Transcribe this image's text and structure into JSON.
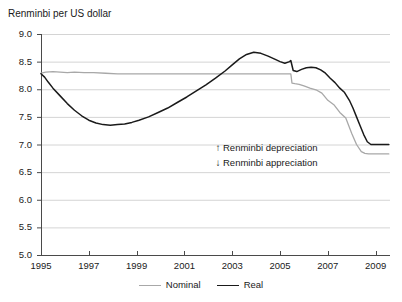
{
  "chart_data": {
    "type": "line",
    "title": "Renminbi per US dollar",
    "xlabel": "",
    "ylabel": "",
    "xlim": [
      1995,
      2009.6
    ],
    "ylim": [
      5.0,
      9.0
    ],
    "grid": true,
    "legend_position": "bottom-center",
    "y_ticks": [
      "9.0",
      "8.5",
      "8.0",
      "7.5",
      "7.0",
      "6.5",
      "6.0",
      "5.5",
      "5.0"
    ],
    "y_tick_values": [
      9.0,
      8.5,
      8.0,
      7.5,
      7.0,
      6.5,
      6.0,
      5.5,
      5.0
    ],
    "x_ticks": [
      "1995",
      "1997",
      "1999",
      "2001",
      "2003",
      "2005",
      "2007",
      "2009"
    ],
    "x_tick_values": [
      1995,
      1997,
      1999,
      2001,
      2003,
      2005,
      2007,
      2009
    ],
    "series": [
      {
        "name": "Nominal",
        "color": "#a8a8a8",
        "width": 1.3,
        "x": [
          1995.0,
          1995.2,
          1995.5,
          1995.8,
          1996.1,
          1996.4,
          1996.8,
          1997.2,
          1997.7,
          1998.2,
          1999.0,
          2000.0,
          2001.0,
          2002.0,
          2003.0,
          2004.0,
          2005.0,
          2005.45,
          2005.5,
          2005.62,
          2005.8,
          2006.0,
          2006.25,
          2006.5,
          2006.75,
          2007.0,
          2007.25,
          2007.5,
          2007.75,
          2008.0,
          2008.2,
          2008.4,
          2008.55,
          2008.7,
          2009.0,
          2009.3,
          2009.55
        ],
        "y": [
          8.29,
          8.31,
          8.32,
          8.31,
          8.3,
          8.31,
          8.3,
          8.3,
          8.29,
          8.28,
          8.28,
          8.28,
          8.28,
          8.28,
          8.28,
          8.28,
          8.28,
          8.28,
          8.11,
          8.1,
          8.09,
          8.06,
          8.02,
          7.99,
          7.93,
          7.8,
          7.72,
          7.58,
          7.48,
          7.2,
          7.0,
          6.87,
          6.84,
          6.83,
          6.83,
          6.83,
          6.83
        ]
      },
      {
        "name": "Real",
        "color": "#1a1a1a",
        "width": 1.5,
        "x": [
          1995.0,
          1995.15,
          1995.3,
          1995.5,
          1995.8,
          1996.1,
          1996.4,
          1996.7,
          1997.0,
          1997.3,
          1997.6,
          1997.9,
          1998.2,
          1998.5,
          1998.8,
          1999.1,
          1999.5,
          1999.9,
          2000.3,
          2000.7,
          2001.1,
          2001.5,
          2001.9,
          2002.3,
          2002.7,
          2003.0,
          2003.3,
          2003.6,
          2003.9,
          2004.2,
          2004.5,
          2004.8,
          2005.0,
          2005.2,
          2005.4,
          2005.45,
          2005.55,
          2005.7,
          2005.9,
          2006.1,
          2006.3,
          2006.5,
          2006.7,
          2006.9,
          2007.1,
          2007.3,
          2007.5,
          2007.7,
          2007.9,
          2008.05,
          2008.2,
          2008.35,
          2008.5,
          2008.65,
          2008.8,
          2009.0,
          2009.3,
          2009.55
        ],
        "y": [
          8.28,
          8.22,
          8.13,
          8.02,
          7.88,
          7.74,
          7.62,
          7.52,
          7.44,
          7.39,
          7.36,
          7.35,
          7.36,
          7.37,
          7.4,
          7.44,
          7.5,
          7.58,
          7.66,
          7.76,
          7.86,
          7.97,
          8.08,
          8.2,
          8.33,
          8.44,
          8.55,
          8.63,
          8.67,
          8.65,
          8.6,
          8.54,
          8.5,
          8.47,
          8.5,
          8.52,
          8.34,
          8.32,
          8.36,
          8.39,
          8.4,
          8.39,
          8.35,
          8.29,
          8.2,
          8.12,
          8.02,
          7.94,
          7.8,
          7.66,
          7.5,
          7.34,
          7.18,
          7.05,
          7.0,
          7.0,
          7.0,
          7.0
        ]
      }
    ],
    "annotations": [
      {
        "arrow": "↑",
        "text": "Renminbi depreciation"
      },
      {
        "arrow": "↓",
        "text": "Renminbi appreciation"
      }
    ]
  }
}
